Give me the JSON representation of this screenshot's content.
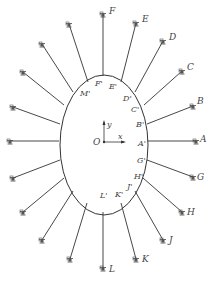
{
  "diagram": {
    "origin": {
      "label": "O",
      "x": 104,
      "y": 142
    },
    "axes": {
      "x_label": "x",
      "y_label": "y"
    },
    "ellipse": {
      "cx": 104,
      "cy": 145,
      "rx": 44,
      "ry": 70
    },
    "cables": [
      {
        "anchor": "F",
        "inner": "F'",
        "ax": 103,
        "ay": 14,
        "ix": 103,
        "iy": 76,
        "alx": 109,
        "aly": 14,
        "ilx": 95,
        "ily": 86
      },
      {
        "anchor": "E",
        "inner": "E'",
        "ax": 136,
        "ay": 23,
        "ix": 121,
        "iy": 82,
        "alx": 142,
        "aly": 22,
        "ilx": 109,
        "ily": 89
      },
      {
        "anchor": "D",
        "inner": "D'",
        "ax": 163,
        "ay": 41,
        "ix": 135,
        "iy": 92,
        "alx": 169,
        "aly": 40,
        "ilx": 123,
        "ily": 101
      },
      {
        "anchor": "C",
        "inner": "C'",
        "ax": 182,
        "ay": 71,
        "ix": 144,
        "iy": 105,
        "alx": 187,
        "aly": 70,
        "ilx": 131,
        "ily": 112
      },
      {
        "anchor": "B",
        "inner": "B'",
        "ax": 193,
        "ay": 106,
        "ix": 147,
        "iy": 124,
        "alx": 197,
        "aly": 104,
        "ilx": 136,
        "ily": 127
      },
      {
        "anchor": "A",
        "inner": "A'",
        "ax": 196,
        "ay": 141,
        "ix": 148,
        "iy": 141,
        "alx": 200,
        "aly": 142,
        "ilx": 138,
        "ily": 146
      },
      {
        "anchor": "G",
        "inner": "G'",
        "ax": 193,
        "ay": 177,
        "ix": 147,
        "iy": 160,
        "alx": 197,
        "aly": 180,
        "ilx": 137,
        "ily": 163
      },
      {
        "anchor": "H",
        "inner": "H'",
        "ax": 182,
        "ay": 212,
        "ix": 143,
        "iy": 178,
        "alx": 187,
        "aly": 215,
        "ilx": 134,
        "ily": 179
      },
      {
        "anchor": "J",
        "inner": "J'",
        "ax": 163,
        "ay": 240,
        "ix": 135,
        "iy": 191,
        "alx": 169,
        "aly": 243,
        "ilx": 127,
        "ily": 189
      },
      {
        "anchor": "K",
        "inner": "K'",
        "ax": 136,
        "ay": 259,
        "ix": 121,
        "iy": 203,
        "alx": 142,
        "aly": 262,
        "ilx": 115,
        "ily": 197
      },
      {
        "anchor": "L",
        "inner": "L'",
        "ax": 103,
        "ay": 268,
        "ix": 103,
        "iy": 212,
        "alx": 109,
        "aly": 272,
        "ilx": 100,
        "ily": 198
      },
      {
        "anchor": "",
        "inner": "",
        "ax": 70,
        "ay": 259,
        "ix": 87,
        "iy": 203
      },
      {
        "anchor": "",
        "inner": "",
        "ax": 42,
        "ay": 240,
        "ix": 73,
        "iy": 191
      },
      {
        "anchor": "",
        "inner": "",
        "ax": 23,
        "ay": 212,
        "ix": 64,
        "iy": 178
      },
      {
        "anchor": "",
        "inner": "",
        "ax": 13,
        "ay": 178,
        "ix": 60,
        "iy": 160
      },
      {
        "anchor": "",
        "inner": "",
        "ax": 10,
        "ay": 141,
        "ix": 59,
        "iy": 141
      },
      {
        "anchor": "",
        "inner": "",
        "ax": 13,
        "ay": 107,
        "ix": 60,
        "iy": 124
      },
      {
        "anchor": "",
        "inner": "",
        "ax": 23,
        "ay": 72,
        "ix": 64,
        "iy": 105
      },
      {
        "anchor": "",
        "inner": "M'",
        "ax": 42,
        "ay": 44,
        "ix": 73,
        "iy": 92,
        "ilx": 80,
        "ily": 96
      },
      {
        "anchor": "",
        "inner": "",
        "ax": 69,
        "ay": 24,
        "ix": 88,
        "iy": 82
      }
    ]
  }
}
